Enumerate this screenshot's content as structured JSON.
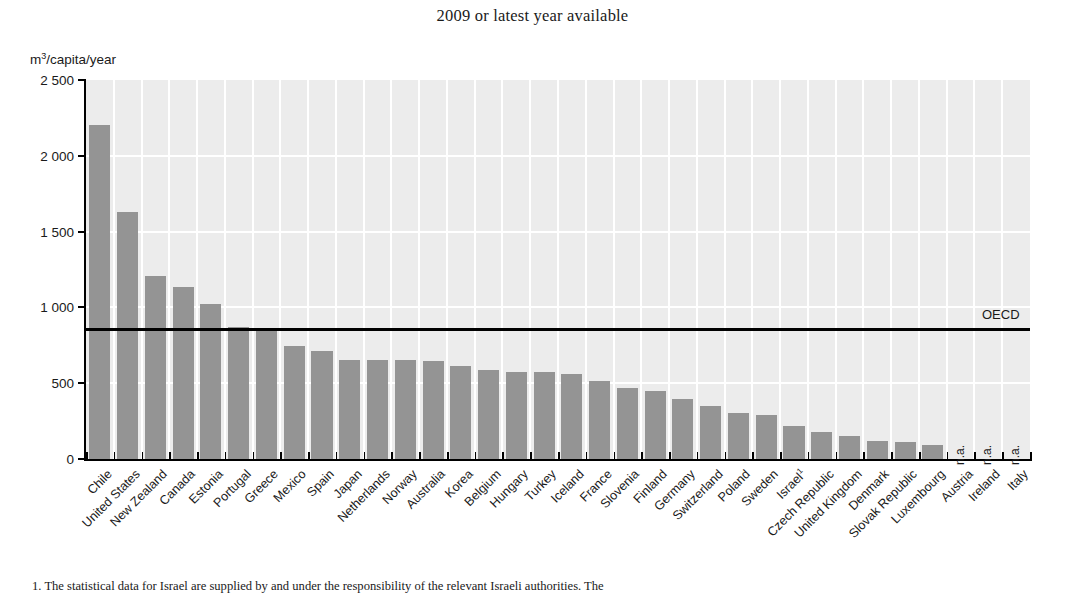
{
  "chart_data": {
    "type": "bar",
    "title": "2009 or latest year available",
    "xlabel": "",
    "ylabel": "m³/capita/year",
    "ylim": [
      0,
      2500
    ],
    "yticks": [
      0,
      500,
      1000,
      1500,
      2000,
      2500
    ],
    "ytick_labels": [
      "0",
      "500",
      "1 000",
      "1 500",
      "2 000",
      "2 500"
    ],
    "grid": true,
    "legend_position": "none",
    "bar_color": "#949494",
    "plot_background": "#ececec",
    "gridline_color": "#ffffff",
    "categories": [
      "Chile",
      "United States",
      "New Zealand",
      "Canada",
      "Estonia",
      "Portugal",
      "Greece",
      "Mexico",
      "Spain",
      "Japan",
      "Netherlands",
      "Norway",
      "Australia",
      "Korea",
      "Belgium",
      "Hungary",
      "Turkey",
      "Iceland",
      "France",
      "Slovenia",
      "Finland",
      "Germany",
      "Switzerland",
      "Poland",
      "Sweden",
      "Israel",
      "Czech Republic",
      "United Kingdom",
      "Denmark",
      "Slovak Republic",
      "Luxembourg",
      "Austria",
      "Ireland",
      "Italy"
    ],
    "values": [
      2200,
      1630,
      1210,
      1135,
      1025,
      870,
      860,
      745,
      715,
      655,
      650,
      650,
      645,
      615,
      590,
      575,
      575,
      560,
      515,
      470,
      450,
      395,
      350,
      305,
      290,
      220,
      180,
      155,
      120,
      115,
      90,
      null,
      null,
      null
    ],
    "na_categories": [
      "Austria",
      "Ireland",
      "Italy"
    ],
    "na_label": "n.a.",
    "footnote_markers": {
      "Israel": "1"
    },
    "reference_line": {
      "label": "OECD",
      "value": 855,
      "color": "#000000"
    }
  },
  "footnote": {
    "marker": "1.",
    "text": "The statistical data for Israel are supplied by and under the responsibility of the relevant Israeli authorities. The"
  }
}
